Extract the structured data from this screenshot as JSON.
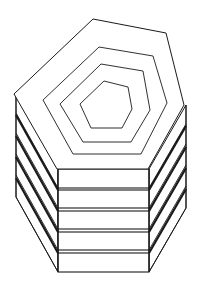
{
  "diagram": {
    "stroke_color": "#1a1a1a",
    "background": "#ffffff",
    "top_face": {
      "outer": [
        [
          93,
          19
        ],
        [
          166,
          33
        ],
        [
          184,
          105
        ],
        [
          148,
          169
        ],
        [
          57,
          169
        ],
        [
          14,
          94
        ]
      ],
      "contours": [
        [
          [
            99,
            47
          ],
          [
            153,
            56
          ],
          [
            167,
            103
          ],
          [
            141,
            154
          ],
          [
            73,
            154
          ],
          [
            43,
            100
          ]
        ],
        [
          [
            101,
            64
          ],
          [
            143,
            71
          ],
          [
            150,
            110
          ],
          [
            131,
            142
          ],
          [
            83,
            142
          ],
          [
            60,
            104
          ]
        ],
        [
          [
            104,
            81
          ],
          [
            128,
            87
          ],
          [
            132,
            109
          ],
          [
            122,
            128
          ],
          [
            91,
            128
          ],
          [
            80,
            104
          ]
        ]
      ]
    },
    "layers": [
      {
        "top": 169,
        "bottom": 188
      },
      {
        "top": 190,
        "bottom": 208
      },
      {
        "top": 211,
        "bottom": 229
      },
      {
        "top": 232,
        "bottom": 250
      },
      {
        "top": 253,
        "bottom": 272
      }
    ],
    "front_x": [
      58,
      149
    ],
    "left_x": 16,
    "right_x": 186,
    "left_top_y": 94,
    "right_top_y": 105
  }
}
